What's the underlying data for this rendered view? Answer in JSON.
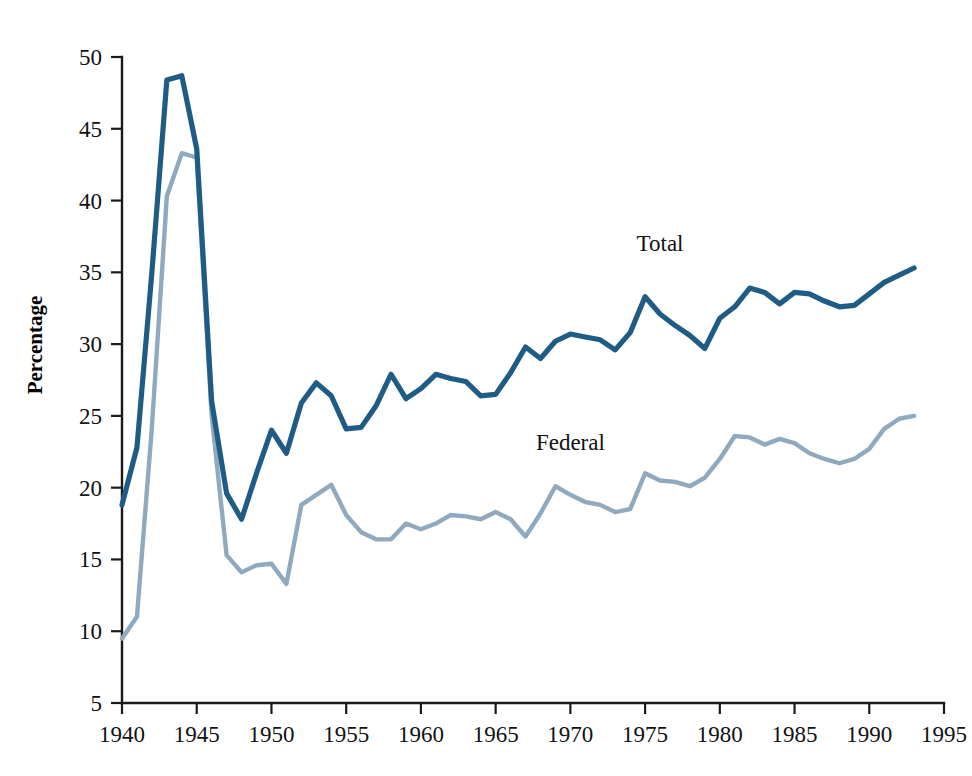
{
  "chart_data": {
    "type": "line",
    "title": "",
    "subtitle": "",
    "xlabel": "",
    "ylabel": "Percentage",
    "xlim": [
      1940,
      1995
    ],
    "ylim": [
      5,
      50
    ],
    "xticks": [
      1940,
      1945,
      1950,
      1955,
      1960,
      1965,
      1970,
      1975,
      1980,
      1985,
      1990,
      1995
    ],
    "yticks": [
      5,
      10,
      15,
      20,
      25,
      30,
      35,
      40,
      45,
      50
    ],
    "grid": false,
    "legend_position": "inline-annotation",
    "x": [
      1940,
      1941,
      1942,
      1943,
      1944,
      1945,
      1946,
      1947,
      1948,
      1949,
      1950,
      1951,
      1952,
      1953,
      1954,
      1955,
      1956,
      1957,
      1958,
      1959,
      1960,
      1961,
      1962,
      1963,
      1964,
      1965,
      1966,
      1967,
      1968,
      1969,
      1970,
      1971,
      1972,
      1973,
      1974,
      1975,
      1976,
      1977,
      1978,
      1979,
      1980,
      1981,
      1982,
      1983,
      1984,
      1985,
      1986,
      1987,
      1988,
      1989,
      1990,
      1991,
      1992,
      1993
    ],
    "series": [
      {
        "name": "Total",
        "color": "#1f5c85",
        "values": [
          18.8,
          22.8,
          35.0,
          48.4,
          48.7,
          43.6,
          26.0,
          19.6,
          17.8,
          21.0,
          24.0,
          22.4,
          25.9,
          27.3,
          26.4,
          24.1,
          24.2,
          25.7,
          27.9,
          26.2,
          26.9,
          27.9,
          27.6,
          27.4,
          26.4,
          26.5,
          28.0,
          29.8,
          29.0,
          30.2,
          30.7,
          30.5,
          30.3,
          29.6,
          30.8,
          33.3,
          32.1,
          31.3,
          30.6,
          29.7,
          31.8,
          32.6,
          33.9,
          33.6,
          32.8,
          33.6,
          33.5,
          33.0,
          32.6,
          32.7,
          33.5,
          34.3,
          34.8,
          35.3
        ]
      },
      {
        "name": "Federal",
        "color": "#8fa9be",
        "values": [
          9.5,
          11.0,
          24.2,
          40.3,
          43.3,
          43.0,
          25.0,
          15.3,
          14.1,
          14.6,
          14.7,
          13.3,
          18.8,
          19.5,
          20.2,
          18.1,
          16.9,
          16.4,
          16.4,
          17.5,
          17.1,
          17.5,
          18.1,
          18.0,
          17.8,
          18.3,
          17.8,
          16.6,
          18.2,
          20.1,
          19.5,
          19.0,
          18.8,
          18.3,
          18.5,
          21.0,
          20.5,
          20.4,
          20.1,
          20.7,
          22.0,
          23.6,
          23.5,
          23.0,
          23.4,
          23.1,
          22.4,
          22.0,
          21.7,
          22.0,
          22.7,
          24.1,
          24.8,
          25.0
        ]
      }
    ],
    "annotations": [
      {
        "text": "Total",
        "x": 1976,
        "y": 36.5,
        "series": "Total"
      },
      {
        "text": "Federal",
        "x": 1970,
        "y": 22.6,
        "series": "Federal"
      }
    ]
  },
  "axis": {
    "y_title": "Percentage",
    "y_tick_labels": [
      "50",
      "45",
      "40",
      "35",
      "30",
      "25",
      "20",
      "15",
      "10",
      "5"
    ],
    "x_tick_labels": [
      "1940",
      "1945",
      "1950",
      "1955",
      "1960",
      "1965",
      "1970",
      "1975",
      "1980",
      "1985",
      "1990",
      "1995"
    ]
  },
  "colors": {
    "total_line": "#1f5c85",
    "federal_line": "#8fa9be",
    "axis": "#1a1a1a",
    "background": "#ffffff"
  }
}
